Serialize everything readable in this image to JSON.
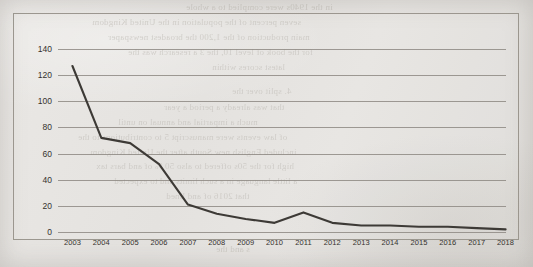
{
  "chart_data": {
    "type": "line",
    "title": "",
    "subtitle": "",
    "xlabel": "",
    "ylabel": "",
    "categories": [
      "2003",
      "2004",
      "2005",
      "2006",
      "2007",
      "2008",
      "2009",
      "2010",
      "2011",
      "2012",
      "2013",
      "2014",
      "2015",
      "2016",
      "2017",
      "2018"
    ],
    "values": [
      127,
      72,
      68,
      52,
      21,
      14,
      10,
      7,
      15,
      7,
      5,
      5,
      4,
      4,
      3,
      2
    ],
    "series": [
      {
        "name": "series-1",
        "values": [
          127,
          72,
          68,
          52,
          21,
          14,
          10,
          7,
          15,
          7,
          5,
          5,
          4,
          4,
          3,
          2
        ]
      }
    ],
    "ylim": [
      0,
      140
    ],
    "yticks": [
      0,
      20,
      40,
      60,
      80,
      100,
      120,
      140
    ],
    "ytick_labels": [
      "0",
      "20",
      "40",
      "60",
      "80",
      "100",
      "120",
      "140"
    ],
    "grid": true,
    "legend": false,
    "legend_position": "none",
    "line_color": "#3d3a36",
    "grid_color": "#8e8a84",
    "frame_color": "#9c9890",
    "background_color": "#e5e3e0",
    "annotations": []
  },
  "page": {
    "background_color": "#e6e4e1",
    "bleed_through_lines": [
      {
        "text": "in the 1940s were complied to a whole",
        "x": 186,
        "y": 2,
        "size": 9
      },
      {
        "text": "seven percent of the population in the United Kingdom",
        "x": 92,
        "y": 17,
        "size": 9
      },
      {
        "text": "main production of the 1,200 the broadest newspaper",
        "x": 108,
        "y": 32,
        "size": 9
      },
      {
        "text": "for the book of level 10, the 3 a research was the",
        "x": 128,
        "y": 47,
        "size": 9
      },
      {
        "text": "latest scores within",
        "x": 212,
        "y": 62,
        "size": 9
      },
      {
        "text": "4. split over the",
        "x": 232,
        "y": 86,
        "size": 9
      },
      {
        "text": "that was already a period a year",
        "x": 164,
        "y": 102,
        "size": 9
      },
      {
        "text": "much a impartial and annual on until",
        "x": 118,
        "y": 117,
        "size": 9
      },
      {
        "text": "of law events were manuscript 5 to contributions to the",
        "x": 78,
        "y": 132,
        "size": 9
      },
      {
        "text": "included English new South after the United Kingdom",
        "x": 90,
        "y": 147,
        "size": 9
      },
      {
        "text": "high for the 50s offered to also 50 % of and bars tax",
        "x": 96,
        "y": 161,
        "size": 9
      },
      {
        "text": "a little language in a such limits and to expected",
        "x": 114,
        "y": 176,
        "size": 9
      },
      {
        "text": "that 2016 of and lined",
        "x": 166,
        "y": 191,
        "size": 9
      },
      {
        "text": "s and the",
        "x": 216,
        "y": 244,
        "size": 9
      }
    ]
  }
}
